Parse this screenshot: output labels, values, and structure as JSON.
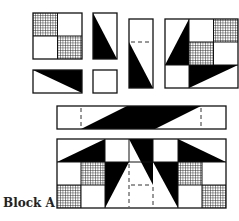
{
  "diagram": {
    "title": "Block A",
    "colors": {
      "outline": "#111111",
      "fill_solid": "#000000",
      "background": "#ffffff",
      "grid_hatch": "#222222"
    },
    "pieces": [
      {
        "id": "four-patch",
        "description": "Four-patch square: hatched top-left and bottom-right, white top-right and bottom-left"
      },
      {
        "id": "tall-triangle-rect",
        "description": "Tall rectangle with black triangle on left side"
      },
      {
        "id": "flat-triangle-rect",
        "description": "Flat rectangle with black triangle in upper right"
      },
      {
        "id": "small-square",
        "description": "Small plain white square"
      },
      {
        "id": "tall-dashed-rect",
        "description": "Tall rectangle with dashed seam line and black triangle at bottom left"
      },
      {
        "id": "star-corner-block",
        "description": "Large block with black star points and hatched four-patch"
      },
      {
        "id": "sashing-strip",
        "description": "Long strip with black parallelogram and dashed seam lines"
      },
      {
        "id": "assembled-block",
        "description": "Assembled Block A with star points, hatched squares and center dashed lines"
      }
    ]
  }
}
